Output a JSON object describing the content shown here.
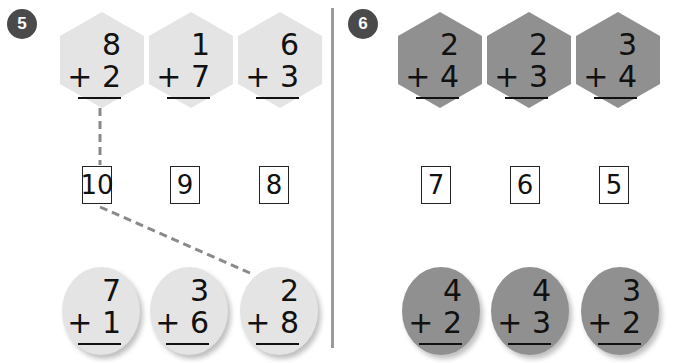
{
  "colors": {
    "light_shape": "#e4e4e4",
    "dark_shape": "#909090",
    "badge": "#4a4a4a",
    "dashed_line": "#8a8a8a",
    "divider": "#9a9a9a"
  },
  "exercise5": {
    "number": "5",
    "top_problems": [
      {
        "top": "8",
        "bottom": "+ 2"
      },
      {
        "top": "1",
        "bottom": "+ 7"
      },
      {
        "top": "6",
        "bottom": "+ 3"
      }
    ],
    "answers": [
      "10",
      "9",
      "8"
    ],
    "bottom_problems": [
      {
        "top": "7",
        "bottom": "+ 1"
      },
      {
        "top": "3",
        "bottom": "+ 6"
      },
      {
        "top": "2",
        "bottom": "+ 8"
      }
    ]
  },
  "exercise6": {
    "number": "6",
    "top_problems": [
      {
        "top": "2",
        "bottom": "+ 4"
      },
      {
        "top": "2",
        "bottom": "+ 3"
      },
      {
        "top": "3",
        "bottom": "+ 4"
      }
    ],
    "answers": [
      "7",
      "6",
      "5"
    ],
    "bottom_problems": [
      {
        "top": "4",
        "bottom": "+ 2"
      },
      {
        "top": "4",
        "bottom": "+ 3"
      },
      {
        "top": "3",
        "bottom": "+ 2"
      }
    ]
  }
}
